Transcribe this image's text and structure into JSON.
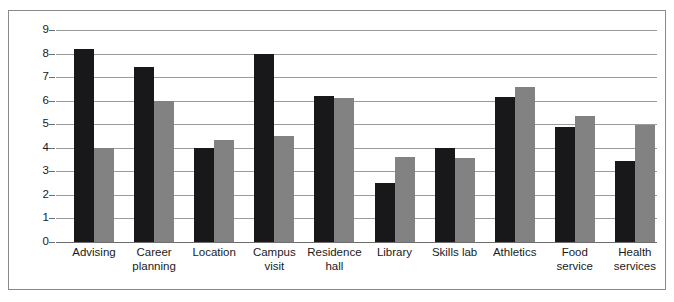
{
  "chart_data": {
    "type": "bar",
    "title": "",
    "subtitle": "",
    "xlabel": "",
    "ylabel": "",
    "ylim": [
      0,
      9
    ],
    "ytick_labels": [
      "0",
      "1",
      "2",
      "3",
      "4",
      "5",
      "6",
      "7",
      "8",
      "9"
    ],
    "yticks": [
      0,
      1,
      2,
      3,
      4,
      5,
      6,
      7,
      8,
      9
    ],
    "grid": true,
    "legend": "none",
    "orientation": "vertical",
    "grouping": "grouped",
    "categories": [
      "Advising",
      "Career planning",
      "Location",
      "Campus visit",
      "Residence hall",
      "Library",
      "Skills lab",
      "Athletics",
      "Food service",
      "Health services"
    ],
    "series": [
      {
        "name": "Series 1",
        "color": "#18181a",
        "values": [
          8.2,
          7.45,
          4.0,
          8.0,
          6.2,
          2.5,
          4.0,
          6.15,
          4.9,
          3.45
        ]
      },
      {
        "name": "Series 2",
        "color": "#828282",
        "values": [
          4.0,
          6.0,
          4.35,
          4.5,
          6.1,
          3.6,
          3.55,
          6.6,
          5.35,
          4.95
        ]
      }
    ]
  },
  "style": {
    "gridline_color": "#9b9b9b",
    "axis_color": "#6e6e6e",
    "frame_color": "#8a8a8a",
    "background": "#ffffff",
    "text_color": "#1a1a1a"
  }
}
